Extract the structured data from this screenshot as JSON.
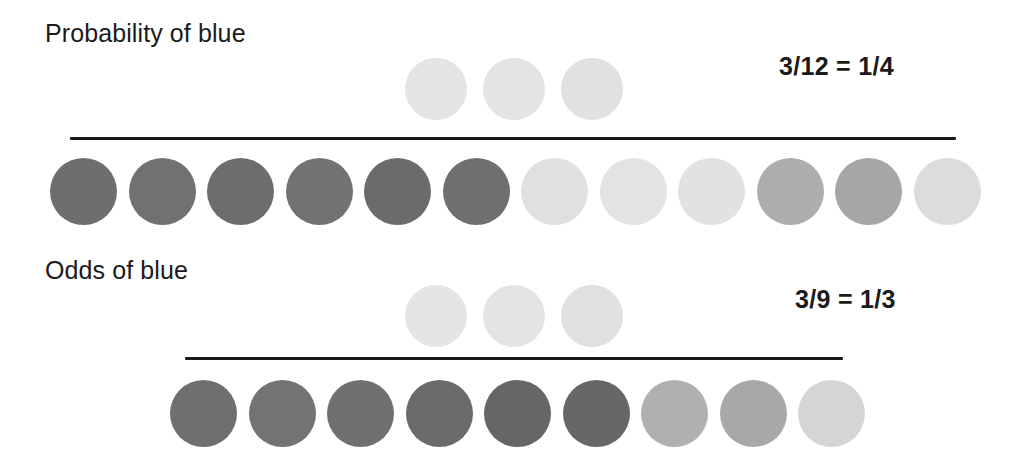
{
  "page": {
    "background": "#ffffff",
    "width": 1011,
    "height": 476
  },
  "palette": {
    "text": "#1b1b1b",
    "rule": "#1a1a1a",
    "dark_gray": "#6f6f6f",
    "dark_gray_alt": "#6a6a6a",
    "mid_gray": "#ababab",
    "light_gray": "#e1e1e1",
    "lighter_gray": "#e6e6e6",
    "pale_gray": "#dcdcdc"
  },
  "sections": [
    {
      "id": "probability",
      "title": "Probability of blue",
      "title_x": 45,
      "title_y": 21,
      "result": "3/12 = 1/4",
      "result_x": 779,
      "result_y": 54,
      "divider": {
        "x": 70,
        "y": 137,
        "width": 886
      },
      "numerator": {
        "label": "numerator-blue-circles",
        "count": 3,
        "y": 58,
        "diameter": 62,
        "start_x": 405,
        "step": 78,
        "circles": [
          {
            "color": "#e4e4e4"
          },
          {
            "color": "#e4e4e4"
          },
          {
            "color": "#e1e1e1"
          }
        ]
      },
      "denominator": {
        "label": "denominator-all-circles",
        "count": 12,
        "y": 158,
        "diameter": 67,
        "start_x": 50,
        "step": 78.5,
        "circles": [
          {
            "color": "#6e6e6e",
            "kind": "non-blue"
          },
          {
            "color": "#717171",
            "kind": "non-blue"
          },
          {
            "color": "#6d6d6d",
            "kind": "non-blue"
          },
          {
            "color": "#727272",
            "kind": "non-blue"
          },
          {
            "color": "#6b6b6b",
            "kind": "non-blue"
          },
          {
            "color": "#6f6f6f",
            "kind": "non-blue"
          },
          {
            "color": "#e0e0e0",
            "kind": "blue"
          },
          {
            "color": "#e3e3e3",
            "kind": "blue"
          },
          {
            "color": "#e2e2e2",
            "kind": "blue"
          },
          {
            "color": "#adadad",
            "kind": "non-blue"
          },
          {
            "color": "#a6a6a6",
            "kind": "non-blue"
          },
          {
            "color": "#dcdcdc",
            "kind": "blue"
          }
        ]
      }
    },
    {
      "id": "odds",
      "title": "Odds of blue",
      "title_x": 45,
      "title_y": 258,
      "result": "3/9 = 1/3",
      "result_x": 795,
      "result_y": 287,
      "divider": {
        "x": 185,
        "y": 357,
        "width": 658
      },
      "numerator": {
        "label": "numerator-blue-circles",
        "count": 3,
        "y": 285,
        "diameter": 62,
        "start_x": 405,
        "step": 78,
        "circles": [
          {
            "color": "#e4e4e4"
          },
          {
            "color": "#e4e4e4"
          },
          {
            "color": "#e1e1e1"
          }
        ]
      },
      "denominator": {
        "label": "denominator-non-blue-circles",
        "count": 9,
        "y": 380,
        "diameter": 67,
        "start_x": 170,
        "step": 78.5,
        "circles": [
          {
            "color": "#6f6f6f",
            "kind": "non-blue"
          },
          {
            "color": "#737373",
            "kind": "non-blue"
          },
          {
            "color": "#707070",
            "kind": "non-blue"
          },
          {
            "color": "#6a6a6a",
            "kind": "non-blue"
          },
          {
            "color": "#666666",
            "kind": "non-blue"
          },
          {
            "color": "#676767",
            "kind": "non-blue"
          },
          {
            "color": "#b0b0b0",
            "kind": "non-blue"
          },
          {
            "color": "#a8a8a8",
            "kind": "non-blue"
          },
          {
            "color": "#d5d5d5",
            "kind": "non-blue"
          }
        ]
      }
    }
  ]
}
